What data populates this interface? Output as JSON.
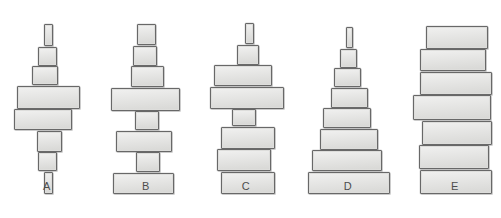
{
  "page": {
    "clipped_header_text": "",
    "background_color": "#ffffff",
    "block_fill_color": "#dddddb",
    "block_border_color": "#6f6f6f",
    "label_color": "#4d4d4d"
  },
  "figures": [
    {
      "label": "A",
      "shape_description": "symmetric double-taper: narrow at top, widest in middle, narrow again at bottom",
      "center_x": 47,
      "blocks": [
        {
          "width": 9,
          "height": 22,
          "offset": 1
        },
        {
          "width": 19,
          "height": 19,
          "offset": 0
        },
        {
          "width": 26,
          "height": 19,
          "offset": -2
        },
        {
          "width": 63,
          "height": 23,
          "offset": 1
        },
        {
          "width": 58,
          "height": 21,
          "offset": -4
        },
        {
          "width": 25,
          "height": 21,
          "offset": 2
        },
        {
          "width": 19,
          "height": 19,
          "offset": 0
        },
        {
          "width": 9,
          "height": 22,
          "offset": 1
        }
      ]
    },
    {
      "label": "B",
      "shape_description": "narrow top blocks, one very wide block, then alternating narrow and wide blocks down to a wide base",
      "center_x": 146,
      "blocks": [
        {
          "width": 19,
          "height": 21,
          "offset": 0
        },
        {
          "width": 24,
          "height": 20,
          "offset": -1
        },
        {
          "width": 33,
          "height": 21,
          "offset": 1
        },
        {
          "width": 69,
          "height": 23,
          "offset": -1
        },
        {
          "width": 24,
          "height": 19,
          "offset": 1
        },
        {
          "width": 56,
          "height": 21,
          "offset": -2
        },
        {
          "width": 24,
          "height": 20,
          "offset": 2
        },
        {
          "width": 61,
          "height": 21,
          "offset": -3
        }
      ]
    },
    {
      "label": "C",
      "shape_description": "thin spire on top, a wide block, then a column of similar wide blocks",
      "center_x": 246,
      "blocks": [
        {
          "width": 9,
          "height": 21,
          "offset": 3
        },
        {
          "width": 22,
          "height": 20,
          "offset": 2
        },
        {
          "width": 58,
          "height": 21,
          "offset": -3
        },
        {
          "width": 74,
          "height": 22,
          "offset": 1
        },
        {
          "width": 24,
          "height": 17,
          "offset": -2
        },
        {
          "width": 54,
          "height": 22,
          "offset": 2
        },
        {
          "width": 54,
          "height": 22,
          "offset": -2
        },
        {
          "width": 54,
          "height": 22,
          "offset": 2
        }
      ]
    },
    {
      "label": "D",
      "shape_description": "regular pyramid: each block steadily wider from the thin top spire to the broad base",
      "center_x": 348,
      "blocks": [
        {
          "width": 7,
          "height": 21,
          "offset": 1
        },
        {
          "width": 17,
          "height": 19,
          "offset": 0
        },
        {
          "width": 27,
          "height": 19,
          "offset": -1
        },
        {
          "width": 37,
          "height": 20,
          "offset": 1
        },
        {
          "width": 48,
          "height": 20,
          "offset": -1
        },
        {
          "width": 58,
          "height": 21,
          "offset": 1
        },
        {
          "width": 70,
          "height": 21,
          "offset": -1
        },
        {
          "width": 82,
          "height": 22,
          "offset": 1
        }
      ]
    },
    {
      "label": "E",
      "shape_description": "uniform column: seven wide blocks of nearly equal width stacked straight up",
      "center_x": 455,
      "blocks": [
        {
          "width": 62,
          "height": 23,
          "offset": 2
        },
        {
          "width": 66,
          "height": 22,
          "offset": -2
        },
        {
          "width": 72,
          "height": 23,
          "offset": 1
        },
        {
          "width": 78,
          "height": 25,
          "offset": -3
        },
        {
          "width": 70,
          "height": 24,
          "offset": 2
        },
        {
          "width": 70,
          "height": 24,
          "offset": -1
        },
        {
          "width": 72,
          "height": 24,
          "offset": 1
        }
      ]
    }
  ]
}
